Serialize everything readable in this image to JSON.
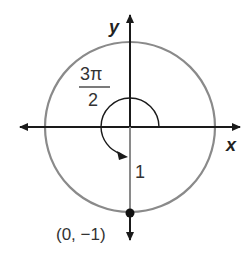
{
  "diagram": {
    "axes": {
      "x_label": "x",
      "y_label": "y"
    },
    "angle": {
      "numerator": "3π",
      "denominator": "2"
    },
    "radius_label": "1",
    "point": {
      "label": "(0, −1)"
    },
    "colors": {
      "circle": "#8a8a8a",
      "axis": "#1a1a1a",
      "point": "#111111"
    }
  }
}
